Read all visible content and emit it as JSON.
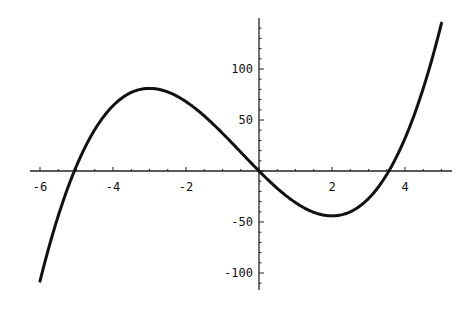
{
  "chart_data": {
    "type": "line",
    "title": "",
    "xlabel": "",
    "ylabel": "",
    "function": "f(x) = 2x^3 + 3x^2 - 36x",
    "xlim": [
      -6,
      5
    ],
    "ylim": [
      -110,
      145
    ],
    "x_ticks": [
      -6,
      -4,
      -2,
      2,
      4
    ],
    "x_tick_labels": [
      "-6",
      "-4",
      "-2",
      "2",
      "4"
    ],
    "y_ticks": [
      100,
      50,
      -50,
      -100
    ],
    "y_tick_labels": [
      "100",
      "50",
      "-50",
      "-100"
    ],
    "x_minor_step": 0.5,
    "y_minor_step": 10,
    "grid": false,
    "legend": null,
    "series": [
      {
        "name": "f(x)",
        "x": [
          -6,
          -5.5,
          -5,
          -4.5,
          -4,
          -3.5,
          -3,
          -2.5,
          -2,
          -1.5,
          -1,
          -0.5,
          0,
          0.5,
          1,
          1.5,
          2,
          2.5,
          3,
          3.5,
          4,
          4.5,
          5
        ],
        "values": [
          -108,
          -50.75,
          -5,
          29.25,
          64,
          77.75,
          81,
          74.75,
          60,
          38.25,
          37,
          18.5,
          0,
          -17,
          -31,
          -40.5,
          -44,
          -39.5,
          -27,
          -5.25,
          32,
          74.25,
          145
        ],
        "color": "#111111"
      }
    ],
    "key_points": {
      "local_max": {
        "x": -3,
        "y": 81
      },
      "local_min": {
        "x": 2,
        "y": -44
      },
      "roots": [
        -5.06,
        0,
        3.56
      ]
    }
  }
}
